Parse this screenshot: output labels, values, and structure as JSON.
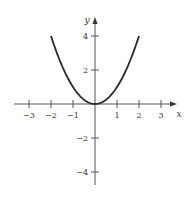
{
  "chart_data": {
    "type": "line",
    "title": "",
    "xlabel": "x",
    "ylabel": "y",
    "function": "y = x^2",
    "domain": [
      -2,
      2
    ],
    "series": [
      {
        "name": "y = x^2",
        "x": [
          -2,
          -1.5,
          -1,
          -0.5,
          0,
          0.5,
          1,
          1.5,
          2
        ],
        "y": [
          4,
          2.25,
          1,
          0.25,
          0,
          0.25,
          1,
          2.25,
          4
        ]
      }
    ],
    "xlim": [
      -3.7,
      3.6
    ],
    "ylim": [
      -4.8,
      5
    ],
    "xticks": [
      -3,
      -2,
      -1,
      1,
      2,
      3
    ],
    "yticks": [
      4,
      2,
      -2,
      -4
    ],
    "xtick_labels": [
      "−3",
      "−2",
      "−1",
      "1",
      "2",
      "3"
    ],
    "ytick_labels": [
      "4",
      "2",
      "−2",
      "−4"
    ],
    "grid": false,
    "legend": null
  },
  "colors": {
    "curve": "#2a2a2a",
    "axis": "#555555",
    "text": "#333333"
  }
}
